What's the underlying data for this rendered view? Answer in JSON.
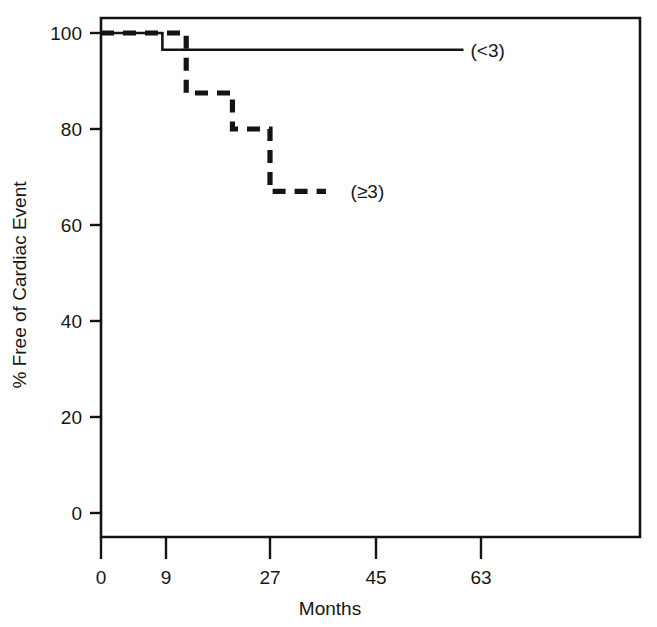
{
  "chart_data": {
    "type": "line",
    "title": "",
    "xlabel": "Months",
    "ylabel": "% Free of Cardiac Event",
    "xticks": [
      0,
      9,
      27,
      45,
      63
    ],
    "xtick_labels": [
      "0",
      "9",
      "27",
      "45",
      "63"
    ],
    "yticks": [
      0,
      20,
      40,
      60,
      80,
      100
    ],
    "ytick_labels": [
      "0",
      "20",
      "40",
      "60",
      "80",
      "100"
    ],
    "xlim": [
      0,
      74
    ],
    "ylim": [
      0,
      104
    ],
    "grid": false,
    "legend_position": "inline-right-of-curve",
    "series": [
      {
        "name": "(<3)",
        "style": "solid",
        "label": "(<3)",
        "label_x": 60,
        "label_y": 96.5,
        "steps": [
          {
            "x": 0,
            "y": 100
          },
          {
            "x": 8.5,
            "y": 100
          },
          {
            "x": 8.5,
            "y": 96.5
          },
          {
            "x": 60,
            "y": 96.5
          }
        ]
      },
      {
        "name": "(≥3)",
        "style": "dashed",
        "label": "(≥3)",
        "label_x": 39.5,
        "label_y": 67,
        "steps": [
          {
            "x": 0,
            "y": 100
          },
          {
            "x": 12.5,
            "y": 100
          },
          {
            "x": 12.5,
            "y": 87.5
          },
          {
            "x": 20.5,
            "y": 87.5
          },
          {
            "x": 20.5,
            "y": 80
          },
          {
            "x": 27,
            "y": 80
          },
          {
            "x": 27,
            "y": 67
          },
          {
            "x": 36.5,
            "y": 67
          }
        ]
      }
    ]
  },
  "axes": {
    "x_title": "Months",
    "y_title": "% Free of Cardiac Event",
    "x_tick_0": "0",
    "x_tick_9": "9",
    "x_tick_27": "27",
    "x_tick_45": "45",
    "x_tick_63": "63",
    "y_tick_0": "0",
    "y_tick_20": "20",
    "y_tick_40": "40",
    "y_tick_60": "60",
    "y_tick_80": "80",
    "y_tick_100": "100"
  },
  "legend": {
    "low_group": "(<3)",
    "high_group": "(≥3)"
  },
  "colors": {
    "ink": "#141414",
    "background": "#ffffff"
  }
}
